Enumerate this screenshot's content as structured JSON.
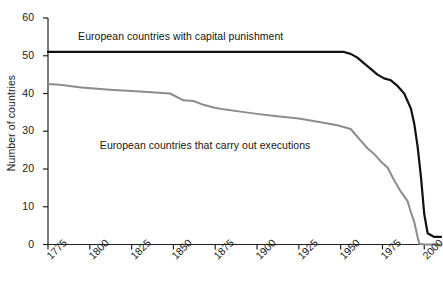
{
  "chart_data": {
    "type": "line",
    "title": "",
    "xlabel": "",
    "ylabel": "Number of countries",
    "xlim": [
      1775,
      2010
    ],
    "ylim": [
      0,
      60
    ],
    "grid": false,
    "legend_position": "inline-labels",
    "xticks": [
      "1775",
      "1800",
      "1825",
      "1850",
      "1875",
      "1900",
      "1925",
      "1950",
      "1975",
      "2000"
    ],
    "xtick_values": [
      1775,
      1800,
      1825,
      1850,
      1875,
      1900,
      1925,
      1950,
      1975,
      2000
    ],
    "yticks": [
      "0",
      "10",
      "20",
      "30",
      "40",
      "50",
      "60"
    ],
    "ytick_values": [
      0,
      10,
      20,
      30,
      40,
      50,
      60
    ],
    "series": [
      {
        "name": "European countries with capital punishment",
        "color": "#111111",
        "width": 2.2,
        "label_x": 1793,
        "label_y": 55,
        "x": [
          1775,
          1800,
          1830,
          1860,
          1890,
          1910,
          1930,
          1945,
          1952,
          1956,
          1960,
          1964,
          1968,
          1972,
          1976,
          1980,
          1984,
          1988,
          1990,
          1992,
          1994,
          1996,
          1998,
          2000,
          2002,
          2006,
          2010
        ],
        "values": [
          51,
          51,
          51,
          51,
          51,
          51,
          51,
          51,
          51,
          50.5,
          49.5,
          48,
          46.5,
          45,
          44,
          43.5,
          42,
          40,
          38,
          36,
          32,
          26,
          18,
          8,
          3,
          2,
          2
        ]
      },
      {
        "name": "European countries that carry out executions",
        "color": "#8c8c8c",
        "width": 2.0,
        "label_x": 1806,
        "label_y": 26,
        "x": [
          1775,
          1782,
          1795,
          1812,
          1830,
          1848,
          1856,
          1862,
          1868,
          1874,
          1880,
          1890,
          1900,
          1912,
          1925,
          1938,
          1948,
          1956,
          1962,
          1966,
          1970,
          1974,
          1978,
          1982,
          1986,
          1990,
          1992,
          1994,
          1996,
          1997,
          2000,
          2010
        ],
        "values": [
          42.5,
          42.3,
          41.6,
          41.0,
          40.5,
          40.0,
          38.2,
          38.0,
          37.0,
          36.3,
          35.8,
          35.2,
          34.6,
          34.0,
          33.4,
          32.4,
          31.6,
          30.6,
          27.5,
          25.5,
          24.0,
          22.0,
          20.4,
          17.0,
          14.0,
          11.5,
          8.5,
          6.0,
          2.0,
          0.2,
          0,
          0
        ]
      }
    ]
  },
  "axes": {
    "ylabel": "Number of countries"
  }
}
